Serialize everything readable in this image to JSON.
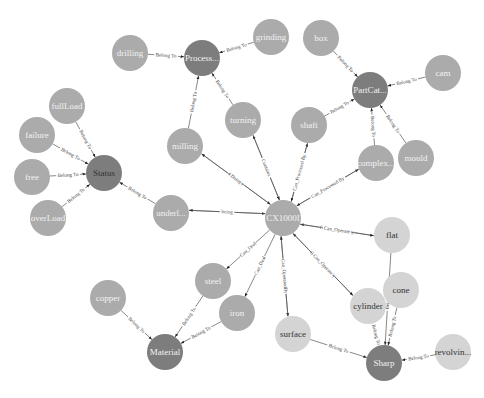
{
  "colors": {
    "dark": "#7d7d7d",
    "mid": "#ababab",
    "light": "#d4d4d4",
    "text_on_dark": "#f2f2f2",
    "text_on_light": "#333333"
  },
  "nodes": [
    {
      "id": "drilling",
      "label": "drilling",
      "tone": "mid"
    },
    {
      "id": "process",
      "label": "Process...",
      "tone": "dark"
    },
    {
      "id": "grinding",
      "label": "grinding",
      "tone": "mid"
    },
    {
      "id": "box",
      "label": "box",
      "tone": "mid"
    },
    {
      "id": "partcat",
      "label": "PartCat...",
      "tone": "dark"
    },
    {
      "id": "cam",
      "label": "cam",
      "tone": "mid"
    },
    {
      "id": "fullload",
      "label": "fullLoad",
      "tone": "mid"
    },
    {
      "id": "failure",
      "label": "failure",
      "tone": "mid"
    },
    {
      "id": "free",
      "label": "free",
      "tone": "mid"
    },
    {
      "id": "status",
      "label": "Status",
      "tone": "dark",
      "dark_text": true
    },
    {
      "id": "overload",
      "label": "overLoad",
      "tone": "mid"
    },
    {
      "id": "milling",
      "label": "milling",
      "tone": "mid"
    },
    {
      "id": "turning",
      "label": "turning",
      "tone": "mid"
    },
    {
      "id": "shaft",
      "label": "shaft",
      "tone": "mid"
    },
    {
      "id": "complex",
      "label": "complex...",
      "tone": "mid"
    },
    {
      "id": "mould",
      "label": "mould",
      "tone": "mid"
    },
    {
      "id": "underl",
      "label": "underl...",
      "tone": "mid"
    },
    {
      "id": "cx1000i",
      "label": "CX1000I",
      "tone": "mid"
    },
    {
      "id": "flat",
      "label": "flat",
      "tone": "light"
    },
    {
      "id": "steel",
      "label": "steel",
      "tone": "mid"
    },
    {
      "id": "iron",
      "label": "iron",
      "tone": "mid"
    },
    {
      "id": "copper",
      "label": "copper",
      "tone": "mid"
    },
    {
      "id": "material",
      "label": "Material",
      "tone": "dark"
    },
    {
      "id": "cylinder",
      "label": "cylinder",
      "tone": "light"
    },
    {
      "id": "cone",
      "label": "cone",
      "tone": "light"
    },
    {
      "id": "surface",
      "label": "surface",
      "tone": "light"
    },
    {
      "id": "sharp",
      "label": "Sharp",
      "tone": "dark"
    },
    {
      "id": "revolvin",
      "label": "revolvin...",
      "tone": "light"
    }
  ],
  "edges": [
    {
      "from": "drilling",
      "to": "process",
      "label": "Belong To"
    },
    {
      "from": "grinding",
      "to": "process",
      "label": "Belong To"
    },
    {
      "from": "milling",
      "to": "process",
      "label": "Belong To"
    },
    {
      "from": "turning",
      "to": "process",
      "label": "Belong To"
    },
    {
      "from": "box",
      "to": "partcat",
      "label": "Belong To"
    },
    {
      "from": "cam",
      "to": "partcat",
      "label": "Belong To"
    },
    {
      "from": "shaft",
      "to": "partcat",
      "label": "Belong To"
    },
    {
      "from": "complex",
      "to": "partcat",
      "label": "Belong To"
    },
    {
      "from": "mould",
      "to": "partcat",
      "label": "Belong To"
    },
    {
      "from": "fullload",
      "to": "status",
      "label": "Belong To"
    },
    {
      "from": "failure",
      "to": "status",
      "label": "Belong To"
    },
    {
      "from": "free",
      "to": "status",
      "label": "Belong To"
    },
    {
      "from": "overload",
      "to": "status",
      "label": "Belong To"
    },
    {
      "from": "underl",
      "to": "status",
      "label": "Belong To"
    },
    {
      "from": "milling",
      "to": "cx1000i",
      "label": "Contains"
    },
    {
      "from": "cx1000i",
      "to": "milling",
      "label": "Doing"
    },
    {
      "from": "cx1000i",
      "to": "turning",
      "label": "Doing"
    },
    {
      "from": "turning",
      "to": "cx1000i",
      "label": "Contains"
    },
    {
      "from": "cx1000i",
      "to": "shaft",
      "label": "Can_Process"
    },
    {
      "from": "shaft",
      "to": "cx1000i",
      "label": "Can_Processed By"
    },
    {
      "from": "cx1000i",
      "to": "complex",
      "label": "Can_Process"
    },
    {
      "from": "complex",
      "to": "cx1000i",
      "label": "Can_Processed By"
    },
    {
      "from": "underl",
      "to": "cx1000i",
      "label": "having"
    },
    {
      "from": "cx1000i",
      "to": "underl",
      "label": "being"
    },
    {
      "from": "flat",
      "to": "cx1000i",
      "label": "Can_OperatedBy"
    },
    {
      "from": "cx1000i",
      "to": "flat",
      "label": "Can_Operate"
    },
    {
      "from": "cylinder",
      "to": "cx1000i",
      "label": "Can_OperatedBy"
    },
    {
      "from": "cx1000i",
      "to": "cylinder",
      "label": "Can_Operate"
    },
    {
      "from": "cx1000i",
      "to": "steel",
      "label": "Can_Deal"
    },
    {
      "from": "cx1000i",
      "to": "iron",
      "label": "Can_Deal"
    },
    {
      "from": "cx1000i",
      "to": "surface",
      "label": "Can_Operate"
    },
    {
      "from": "surface",
      "to": "cx1000i",
      "label": "Can_OperatedBy"
    },
    {
      "from": "copper",
      "to": "material",
      "label": "Belong To"
    },
    {
      "from": "steel",
      "to": "material",
      "label": "Belong To"
    },
    {
      "from": "iron",
      "to": "material",
      "label": "Belong To"
    },
    {
      "from": "flat",
      "to": "sharp",
      "label": "Belong To"
    },
    {
      "from": "cylinder",
      "to": "sharp",
      "label": "Belong To"
    },
    {
      "from": "cone",
      "to": "sharp",
      "label": "Belong To"
    },
    {
      "from": "surface",
      "to": "sharp",
      "label": "Belong To"
    },
    {
      "from": "revolvin",
      "to": "sharp",
      "label": "Belong To"
    }
  ]
}
